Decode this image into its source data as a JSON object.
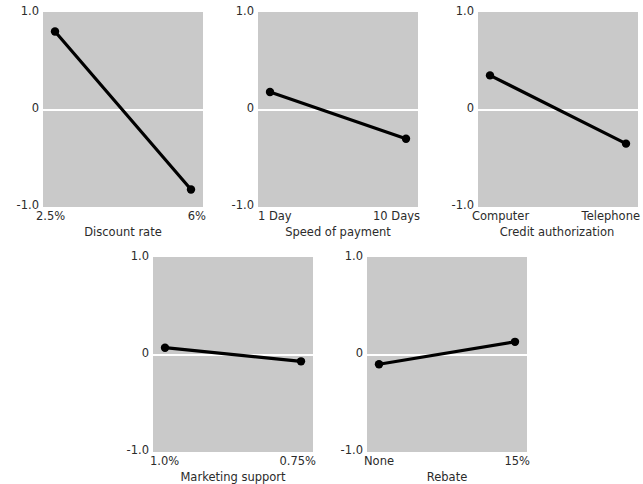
{
  "figure": {
    "caption": "",
    "plot_background_color": "#c9c9c9",
    "zero_line_color": "#ffffff",
    "series_color": "#000000",
    "y_axis_labels": [
      "1.0",
      "0",
      "-1.0"
    ],
    "ylim": [
      -1.0,
      1.0
    ]
  },
  "chart_data": {
    "type": "line",
    "title": "",
    "xlabel": "",
    "ylabel": "",
    "ylim": [
      -1.0,
      1.0
    ],
    "grid": false,
    "legend": "none",
    "panels": [
      {
        "id": "discount-rate",
        "xlabel": "Discount rate",
        "categories": [
          "2.5%",
          "6%"
        ],
        "values": [
          0.8,
          -0.82
        ],
        "yticks": [
          "1.0",
          "0",
          "-1.0"
        ]
      },
      {
        "id": "speed-of-payment",
        "xlabel": "Speed of payment",
        "categories": [
          "1 Day",
          "10 Days"
        ],
        "values": [
          0.18,
          -0.3
        ],
        "yticks": [
          "1.0",
          "0",
          "-1.0"
        ]
      },
      {
        "id": "credit-authorization",
        "xlabel": "Credit authorization",
        "categories": [
          "Computer",
          "Telephone"
        ],
        "values": [
          0.35,
          -0.35
        ],
        "yticks": [
          "1.0",
          "0",
          "-1.0"
        ]
      },
      {
        "id": "marketing-support",
        "xlabel": "Marketing support",
        "categories": [
          "1.0%",
          "0.75%"
        ],
        "values": [
          0.07,
          -0.07
        ],
        "yticks": [
          "1.0",
          "0",
          "-1.0"
        ]
      },
      {
        "id": "rebate",
        "xlabel": "Rebate",
        "categories": [
          "None",
          "15%"
        ],
        "values": [
          -0.1,
          0.13
        ],
        "yticks": [
          "1.0",
          "0",
          "-1.0"
        ]
      }
    ]
  }
}
